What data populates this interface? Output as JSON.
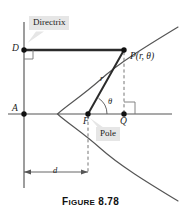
{
  "figure": {
    "caption_prefix": "F",
    "caption_rest": "IGURE",
    "caption_number": "8.78",
    "caption_full": "FIGURE 8.78"
  },
  "labels": {
    "directrix": "Directrix",
    "pole": "Pole",
    "point_d": "D",
    "point_a": "A",
    "point_f": "F",
    "point_q": "Q",
    "point_p": "P(r, θ)",
    "radius": "r",
    "theta": "θ",
    "distance_d": "d"
  },
  "colors": {
    "ink": "#1a1a1a",
    "curve": "#555555",
    "axis": "#555555",
    "heavy": "#2b2b2b",
    "callout_bg": "#e6e6e6",
    "dashed": "#666666",
    "background": "#ffffff"
  },
  "geometry": {
    "directrix_x": 24,
    "axis_y": 114,
    "point_d": [
      24,
      50
    ],
    "point_a": [
      24,
      114
    ],
    "point_f": [
      88,
      114
    ],
    "point_q": [
      124,
      114
    ],
    "point_p": [
      124,
      50
    ],
    "vertex": [
      57,
      114
    ],
    "dimension_y": 172,
    "dimension_from_x": 24,
    "dimension_to_x": 88
  }
}
